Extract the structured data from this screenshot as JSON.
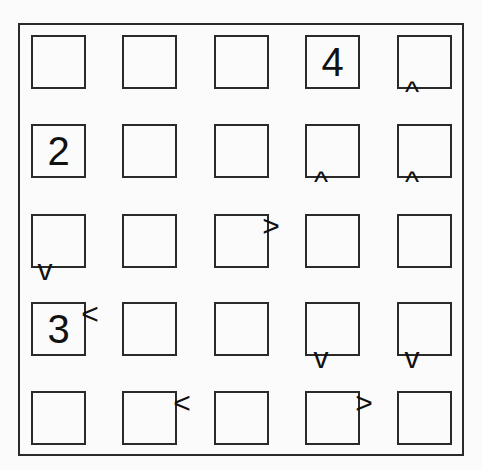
{
  "puzzle": {
    "type": "futoshiki",
    "size": 5,
    "grid": [
      [
        "",
        "",
        "",
        "4",
        ""
      ],
      [
        "2",
        "",
        "",
        "",
        ""
      ],
      [
        "",
        "",
        "",
        "",
        ""
      ],
      [
        "3",
        "",
        "",
        "",
        ""
      ],
      [
        "",
        "",
        "",
        "",
        ""
      ]
    ],
    "inequalities": [
      {
        "id": "r0c4-r1c4",
        "symbol": "^",
        "x": 412,
        "y": 92
      },
      {
        "id": "r1c3-r2c3",
        "symbol": "^",
        "x": 321,
        "y": 182
      },
      {
        "id": "r1c4-r2c4",
        "symbol": "^",
        "x": 412,
        "y": 182
      },
      {
        "id": "r2c2-r2c3",
        "symbol": ">",
        "x": 271,
        "y": 226
      },
      {
        "id": "r2c0-r3c0",
        "symbol": "v",
        "x": 45,
        "y": 270
      },
      {
        "id": "r3c0-r3c1",
        "symbol": "<",
        "x": 90,
        "y": 314
      },
      {
        "id": "r3c3-r4c3",
        "symbol": "v",
        "x": 321,
        "y": 358
      },
      {
        "id": "r3c4-r4c4",
        "symbol": "v",
        "x": 412,
        "y": 358
      },
      {
        "id": "r4c1-r4c2",
        "symbol": "<",
        "x": 182,
        "y": 403
      },
      {
        "id": "r4c3-r4c4",
        "symbol": ">",
        "x": 364,
        "y": 403
      }
    ]
  }
}
